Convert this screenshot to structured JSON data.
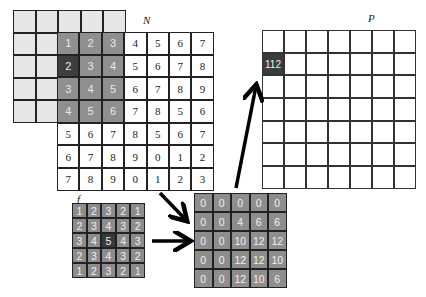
{
  "labels": {
    "N": "N",
    "P": "P",
    "f": "f"
  },
  "padding_grid": {
    "rows": 5,
    "cols": 5
  },
  "N": {
    "rows": [
      [
        "1",
        "2",
        "3",
        "4",
        "5",
        "6",
        "7"
      ],
      [
        "2",
        "3",
        "4",
        "5",
        "6",
        "7",
        "8"
      ],
      [
        "3",
        "4",
        "5",
        "6",
        "7",
        "8",
        "9"
      ],
      [
        "4",
        "5",
        "6",
        "7",
        "8",
        "5",
        "6"
      ],
      [
        "5",
        "6",
        "7",
        "8",
        "5",
        "6",
        "7"
      ],
      [
        "6",
        "7",
        "8",
        "9",
        "0",
        "1",
        "2"
      ],
      [
        "7",
        "8",
        "9",
        "0",
        "1",
        "2",
        "3"
      ]
    ],
    "overlap_region": {
      "rows": 4,
      "cols": 3
    },
    "highlight": [
      1,
      0
    ]
  },
  "f": {
    "rows": [
      [
        "1",
        "2",
        "3",
        "2",
        "1"
      ],
      [
        "2",
        "3",
        "4",
        "3",
        "2"
      ],
      [
        "3",
        "4",
        "5",
        "4",
        "3"
      ],
      [
        "2",
        "3",
        "4",
        "3",
        "2"
      ],
      [
        "1",
        "2",
        "3",
        "2",
        "1"
      ]
    ],
    "highlight": [
      2,
      2
    ]
  },
  "product": {
    "rows": [
      [
        "0",
        "0",
        "0",
        "0",
        "0"
      ],
      [
        "0",
        "0",
        "4",
        "6",
        "6"
      ],
      [
        "0",
        "0",
        "10",
        "12",
        "12"
      ],
      [
        "0",
        "0",
        "12",
        "12",
        "10"
      ],
      [
        "0",
        "0",
        "12",
        "10",
        "6"
      ]
    ]
  },
  "P": {
    "rows": 7,
    "cols": 7,
    "highlight": [
      1,
      0
    ],
    "highlight_value": "112"
  },
  "colors": {
    "padding": "#e6e6e6",
    "overlap": "#8f8f8f",
    "highlight": "#3e3e3e",
    "grid_line": "#222222"
  }
}
